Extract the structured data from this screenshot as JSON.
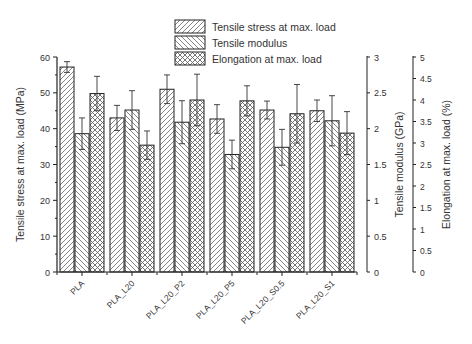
{
  "chart_data": {
    "type": "bar",
    "title": "",
    "categories": [
      "PLA",
      "PLA_L20",
      "PLA_L20_P2",
      "PLA_L20_P5",
      "PLA_L20_S0.5",
      "PLA_L20_S1"
    ],
    "category_labels_display": [
      "PLA",
      "PLA_L20",
      "PLA_L20_P2",
      "PLA_L20_P5",
      "PLA_L20_S0.5",
      "PLA_L20_S1"
    ],
    "series": [
      {
        "name": "Tensile stress at max. load",
        "axis": "left",
        "pattern": "diagonal-up",
        "values": [
          57.2,
          43.0,
          51.0,
          42.7,
          45.2,
          45.0
        ],
        "errors": [
          1.5,
          3.5,
          4.0,
          4.0,
          2.5,
          3.0
        ]
      },
      {
        "name": "Tensile modulus",
        "axis": "right1",
        "pattern": "diagonal-down",
        "values": [
          1.93,
          2.26,
          2.09,
          1.64,
          1.74,
          2.11
        ],
        "errors": [
          0.22,
          0.27,
          0.3,
          0.2,
          0.25,
          0.35
        ]
      },
      {
        "name": "Elongation at max. load",
        "axis": "right2",
        "pattern": "crosshatch",
        "values": [
          4.15,
          2.95,
          4.0,
          3.98,
          3.68,
          3.23
        ],
        "errors": [
          0.4,
          0.33,
          0.6,
          0.35,
          0.68,
          0.5
        ]
      }
    ],
    "axes": {
      "left": {
        "label": "Tensile stress at max. load (MPa)",
        "ylim": [
          0,
          60
        ],
        "ticks": [
          "0",
          "10",
          "20",
          "30",
          "40",
          "50",
          "60"
        ]
      },
      "right1": {
        "label": "Tensile modulus (GPa)",
        "ylim": [
          0,
          3
        ],
        "ticks": [
          "0",
          "0.5",
          "1",
          "1.5",
          "2",
          "2.5",
          "3"
        ]
      },
      "right2": {
        "label": "Elongation at max. load (%)",
        "ylim": [
          0,
          5
        ],
        "ticks": [
          "0",
          "0.5",
          "1",
          "1.5",
          "2",
          "2.5",
          "3",
          "3.5",
          "4",
          "4.5",
          "5"
        ]
      }
    },
    "xlabel": "",
    "grid": false,
    "legend_position": "top-center"
  }
}
